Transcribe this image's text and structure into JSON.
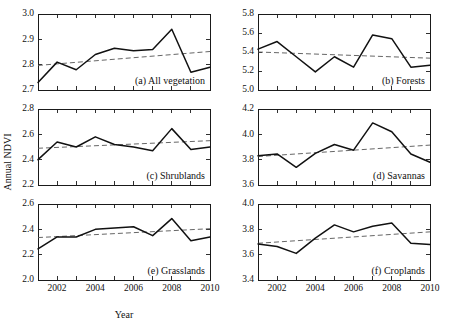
{
  "figure": {
    "xlabel": "Year",
    "ylabel": "Annual NDVI",
    "x_tick_labels": [
      "2002",
      "2004",
      "2006",
      "2008",
      "2010"
    ],
    "line_color": "#111111",
    "trend_color": "#555555"
  },
  "chart_data": [
    {
      "type": "line",
      "title": "(a) All vegetation",
      "xlabel": "",
      "ylabel": "Annual NDVI",
      "x": [
        2001,
        2002,
        2003,
        2004,
        2005,
        2006,
        2007,
        2008,
        2009,
        2010
      ],
      "values": [
        2.73,
        2.81,
        2.78,
        2.84,
        2.865,
        2.855,
        2.86,
        2.94,
        2.77,
        2.79
      ],
      "ylim": [
        2.7,
        3.0
      ],
      "xlim": [
        2001,
        2010
      ],
      "yticks": [
        2.7,
        2.8,
        2.9,
        3.0
      ],
      "ytick_labels": [
        "2.7",
        "2.8",
        "2.9",
        "3.0"
      ],
      "trend": {
        "name": "linear trend",
        "start": 2.797,
        "end": 2.852
      },
      "grid": false,
      "legend": "none"
    },
    {
      "type": "line",
      "title": "(b) Forests",
      "xlabel": "",
      "ylabel": "Annual NDVI",
      "x": [
        2001,
        2002,
        2003,
        2004,
        2005,
        2006,
        2007,
        2008,
        2009,
        2010
      ],
      "values": [
        5.43,
        5.51,
        5.35,
        5.19,
        5.35,
        5.24,
        5.58,
        5.54,
        5.24,
        5.26
      ],
      "ylim": [
        5.0,
        5.8
      ],
      "xlim": [
        2001,
        2010
      ],
      "yticks": [
        5.0,
        5.2,
        5.4,
        5.6,
        5.8
      ],
      "ytick_labels": [
        "5.0",
        "5.2",
        "5.4",
        "5.6",
        "5.8"
      ],
      "trend": {
        "name": "linear trend",
        "start": 5.4,
        "end": 5.335
      },
      "grid": false,
      "legend": "none"
    },
    {
      "type": "line",
      "title": "(c) Shrublands",
      "xlabel": "",
      "ylabel": "Annual NDVI",
      "x": [
        2001,
        2002,
        2003,
        2004,
        2005,
        2006,
        2007,
        2008,
        2009,
        2010
      ],
      "values": [
        2.4,
        2.54,
        2.5,
        2.58,
        2.52,
        2.5,
        2.47,
        2.645,
        2.48,
        2.5
      ],
      "ylim": [
        2.2,
        2.8
      ],
      "xlim": [
        2001,
        2010
      ],
      "yticks": [
        2.2,
        2.4,
        2.6,
        2.8
      ],
      "ytick_labels": [
        "2.2",
        "2.4",
        "2.6",
        "2.8"
      ],
      "trend": {
        "name": "linear trend",
        "start": 2.49,
        "end": 2.55
      },
      "grid": false,
      "legend": "none"
    },
    {
      "type": "line",
      "title": "(d) Savannas",
      "xlabel": "",
      "ylabel": "Annual NDVI",
      "x": [
        2001,
        2002,
        2003,
        2004,
        2005,
        2006,
        2007,
        2008,
        2009,
        2010
      ],
      "values": [
        3.83,
        3.845,
        3.74,
        3.85,
        3.92,
        3.875,
        4.09,
        4.02,
        3.845,
        3.78
      ],
      "ylim": [
        3.6,
        4.2
      ],
      "xlim": [
        2001,
        2010
      ],
      "yticks": [
        3.6,
        3.8,
        4.0,
        4.2
      ],
      "ytick_labels": [
        "3.6",
        "3.8",
        "4.0",
        "4.2"
      ],
      "trend": {
        "name": "linear trend",
        "start": 3.825,
        "end": 3.915
      },
      "grid": false,
      "legend": "none"
    },
    {
      "type": "line",
      "title": "(e) Grasslands",
      "xlabel": "Year",
      "ylabel": "Annual NDVI",
      "x": [
        2001,
        2002,
        2003,
        2004,
        2005,
        2006,
        2007,
        2008,
        2009,
        2010
      ],
      "values": [
        2.245,
        2.34,
        2.34,
        2.4,
        2.41,
        2.42,
        2.35,
        2.485,
        2.31,
        2.34
      ],
      "ylim": [
        2.0,
        2.6
      ],
      "xlim": [
        2001,
        2010
      ],
      "yticks": [
        2.0,
        2.2,
        2.4,
        2.6
      ],
      "ytick_labels": [
        "2.0",
        "2.2",
        "2.4",
        "2.6"
      ],
      "trend": {
        "name": "linear trend",
        "start": 2.335,
        "end": 2.405
      },
      "grid": false,
      "legend": "none"
    },
    {
      "type": "line",
      "title": "(f) Croplands",
      "xlabel": "Year",
      "ylabel": "Annual NDVI",
      "x": [
        2001,
        2002,
        2003,
        2004,
        2005,
        2006,
        2007,
        2008,
        2009,
        2010
      ],
      "values": [
        3.685,
        3.665,
        3.61,
        3.73,
        3.835,
        3.78,
        3.825,
        3.85,
        3.69,
        3.68
      ],
      "ylim": [
        3.4,
        4.0
      ],
      "xlim": [
        2001,
        2010
      ],
      "yticks": [
        3.4,
        3.6,
        3.8,
        4.0
      ],
      "ytick_labels": [
        "3.4",
        "3.6",
        "3.8",
        "4.0"
      ],
      "trend": {
        "name": "linear trend",
        "start": 3.69,
        "end": 3.78
      },
      "grid": false,
      "legend": "none"
    }
  ]
}
